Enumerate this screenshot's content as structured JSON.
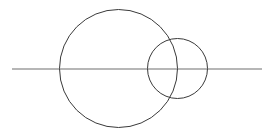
{
  "diagram": {
    "colors": {
      "background": "#ffffff",
      "circle_stroke": "#3a3a3a",
      "line_stroke": "#6e6e6e"
    },
    "shapes": [
      {
        "id": "large-circle",
        "type": "circle",
        "label": ""
      },
      {
        "id": "small-circle",
        "type": "circle",
        "label": ""
      },
      {
        "id": "horizontal-line",
        "type": "line",
        "label": ""
      }
    ]
  }
}
